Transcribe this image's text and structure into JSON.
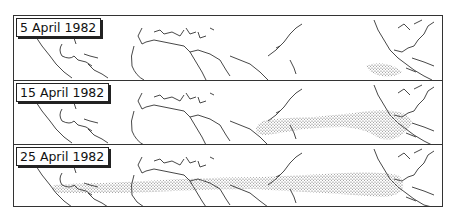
{
  "figure": {
    "panels": [
      {
        "label": "5 April 1982",
        "plume": "small plume over Mexico / Gulf of Mexico region"
      },
      {
        "label": "15 April 1982",
        "plume": "plume extending westward across Pacific from Mexico toward Asia"
      },
      {
        "label": "25 April 1982",
        "plume": "plume encircling the globe from the Americas across Africa, Asia and the Pacific"
      }
    ],
    "colors": {
      "coastline": "#333333",
      "plume": "#555555",
      "frame": "#333333",
      "background": "#ffffff"
    }
  }
}
